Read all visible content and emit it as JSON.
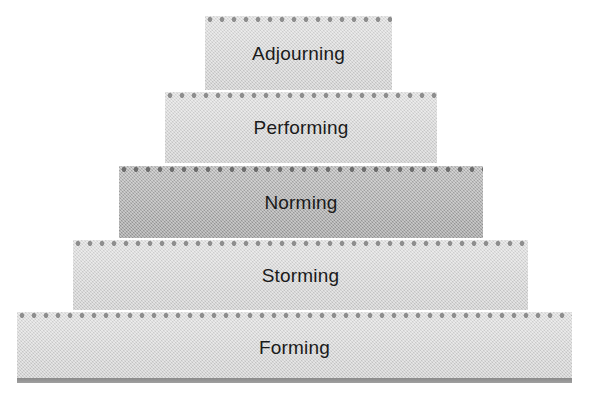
{
  "diagram": {
    "type": "pyramid-stack",
    "orientation": "bottom-wide",
    "tier_count": 5,
    "tiers": [
      {
        "label": "Adjourning",
        "level": 5,
        "tone": "light",
        "fill_color": "#d3d3d3",
        "dot_color": "#8e8e8e",
        "text_color": "#1a1a1a",
        "x": 205,
        "y": 16,
        "width": 187,
        "height": 74
      },
      {
        "label": "Performing",
        "level": 4,
        "tone": "light",
        "fill_color": "#d3d3d3",
        "dot_color": "#8e8e8e",
        "text_color": "#1a1a1a",
        "x": 165,
        "y": 92,
        "width": 272,
        "height": 71
      },
      {
        "label": "Norming",
        "level": 3,
        "tone": "dark",
        "fill_color": "#a8a8a8",
        "dot_color": "#6f6f6f",
        "text_color": "#1a1a1a",
        "x": 119,
        "y": 166,
        "width": 364,
        "height": 72
      },
      {
        "label": "Storming",
        "level": 2,
        "tone": "light",
        "fill_color": "#d3d3d3",
        "dot_color": "#8e8e8e",
        "text_color": "#1a1a1a",
        "x": 73,
        "y": 240,
        "width": 455,
        "height": 70
      },
      {
        "label": "Forming",
        "level": 1,
        "tone": "light",
        "fill_color": "#d3d3d3",
        "dot_color": "#8e8e8e",
        "text_color": "#1a1a1a",
        "x": 17,
        "y": 312,
        "width": 555,
        "height": 71
      }
    ],
    "base_bar": {
      "color": "#8a8a8a",
      "x": 17,
      "y": 378,
      "width": 555,
      "height": 5
    },
    "background_color": "#ffffff"
  }
}
